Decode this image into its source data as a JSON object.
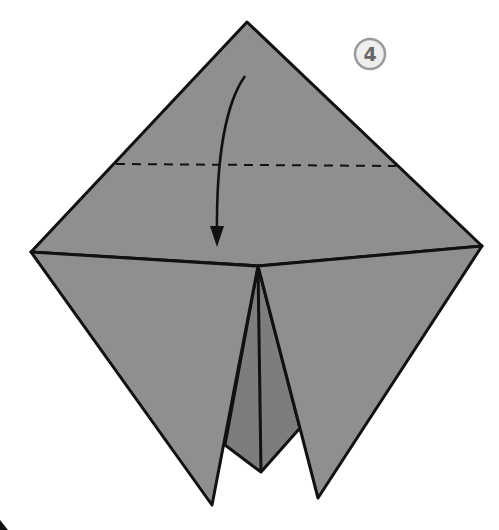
{
  "diagram": {
    "type": "origami-fold-step",
    "step_number": "4",
    "colors": {
      "paper": "#8f8f8f",
      "paper_inner": "#7a7a7a",
      "outline": "#111111",
      "step_circle_fill": "#eeeeee",
      "step_circle_stroke": "#9a9a9a",
      "step_text": "#666666"
    },
    "fold_line": {
      "style": "dashed",
      "label": "valley fold"
    },
    "arrow": {
      "direction": "down",
      "label": "fold top point down"
    }
  }
}
